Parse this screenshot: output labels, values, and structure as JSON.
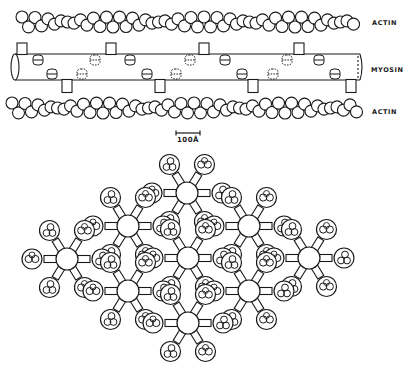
{
  "figure": {
    "stroke_color": "#1a1a1a",
    "background": "#ffffff",
    "longitudinal_view": {
      "labels": {
        "actin_top": "ACTIN",
        "myosin": "MYOSIN",
        "actin_bottom": "ACTIN"
      },
      "actin_top": {
        "x_start": 22,
        "x_end": 358,
        "y_upper": 17,
        "y_lower": 27,
        "bead_radius": 6,
        "pitch": 13
      },
      "actin_bottom": {
        "x_start": 12,
        "x_end": 362,
        "y_upper": 103,
        "y_lower": 113,
        "bead_radius": 6,
        "pitch": 13
      },
      "myosin": {
        "x_left": 15,
        "x_right": 360,
        "y_top": 54,
        "y_bottom": 80,
        "tabs_up": [
          22,
          111,
          204,
          299
        ],
        "tabs_down": [
          67,
          160,
          253,
          351
        ],
        "heads_top": [
          {
            "x": 38,
            "dashed": false
          },
          {
            "x": 95,
            "dashed": true
          },
          {
            "x": 130,
            "dashed": false
          },
          {
            "x": 190,
            "dashed": true
          },
          {
            "x": 225,
            "dashed": false
          },
          {
            "x": 287,
            "dashed": true
          },
          {
            "x": 319,
            "dashed": false
          }
        ],
        "heads_bottom": [
          {
            "x": 52,
            "dashed": false
          },
          {
            "x": 82,
            "dashed": true
          },
          {
            "x": 147,
            "dashed": false
          },
          {
            "x": 176,
            "dashed": true
          },
          {
            "x": 242,
            "dashed": false
          },
          {
            "x": 273,
            "dashed": true
          },
          {
            "x": 335,
            "dashed": false
          }
        ]
      }
    },
    "scale_bar": {
      "label": "100Å",
      "x1": 176,
      "x2": 200,
      "y": 133
    },
    "cross_section": {
      "thick_radius": 11,
      "actin_radius": 10,
      "thick_filaments": [
        {
          "x": 187,
          "y": 193
        },
        {
          "x": 128,
          "y": 226
        },
        {
          "x": 249,
          "y": 226
        },
        {
          "x": 67,
          "y": 259
        },
        {
          "x": 188,
          "y": 258
        },
        {
          "x": 309,
          "y": 258
        },
        {
          "x": 128,
          "y": 291
        },
        {
          "x": 249,
          "y": 291
        },
        {
          "x": 188,
          "y": 323
        }
      ]
    }
  }
}
